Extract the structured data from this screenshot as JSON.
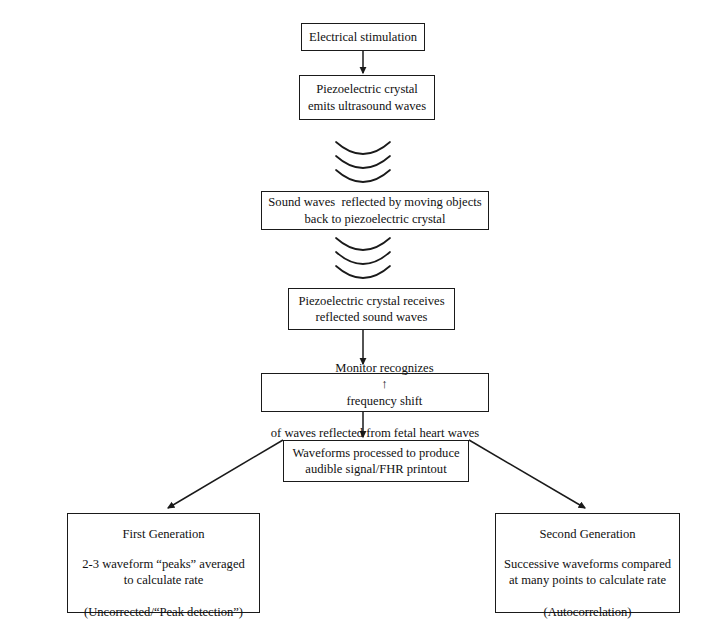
{
  "diagram": {
    "background": "#ffffff",
    "stroke": "#1a1a1a",
    "nodes": {
      "electrical_stimulation": {
        "lines": [
          "Electrical stimulation"
        ]
      },
      "piezo_emits": {
        "lines": [
          "Piezoelectric crystal",
          "emits ultrasound waves"
        ]
      },
      "sound_reflected": {
        "lines": [
          "Sound waves  reflected by moving objects",
          "back to piezoelectric crystal"
        ]
      },
      "piezo_receives": {
        "lines": [
          "Piezoelectric crystal receives",
          "reflected sound waves"
        ]
      },
      "monitor_recognizes": {
        "line1_before": "Monitor recognizes",
        "arrow_glyph": "↑",
        "line1_after": "frequency shift",
        "line2": "of waves reflected from fetal heart waves"
      },
      "waveforms_processed": {
        "lines": [
          "Waveforms processed to produce",
          "audible signal/FHR printout"
        ]
      },
      "first_generation": {
        "title": "First Generation",
        "body": [
          "2-3 waveform “peaks” averaged",
          "to calculate rate"
        ],
        "footer": "(Uncorrected/“Peak detection”)"
      },
      "second_generation": {
        "title": "Second Generation",
        "body": [
          "Successive waveforms compared",
          "at many points to calculate rate"
        ],
        "footer": "(Autocorrelation)"
      }
    },
    "wave_symbols": {
      "emitted_waves_label": "ultrasound-waves-emitted",
      "reflected_waves_label": "ultrasound-waves-reflected",
      "arc_count": 3
    }
  }
}
